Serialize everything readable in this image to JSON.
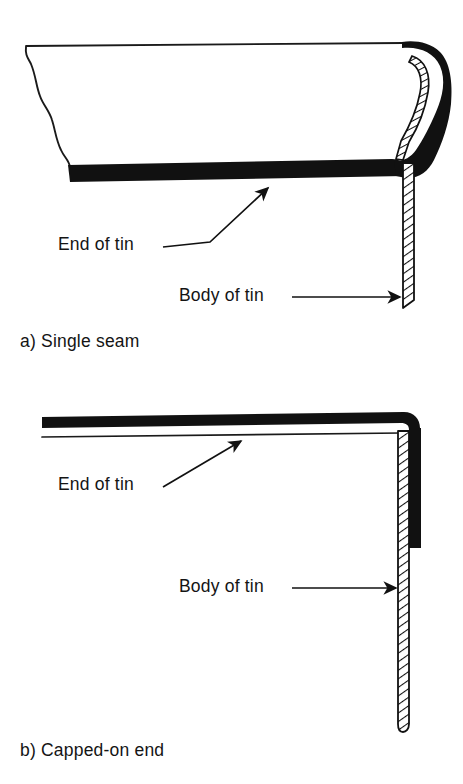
{
  "figure": {
    "kind": "technical-line-drawing",
    "ink_color": "#111111",
    "paper_color": "#ffffff",
    "panels": [
      {
        "id": "a",
        "caption": "a) Single seam",
        "caption_prefix": "a)",
        "caption_text": "Single seam",
        "annotations": [
          {
            "id": "end-of-tin",
            "label": "End of tin",
            "leader": "bent-line-with-arrowhead",
            "points_to": "thick black horizontal end panel"
          },
          {
            "id": "body-of-tin",
            "label": "Body of tin",
            "leader": "straight-horizontal-line-with-arrowhead",
            "points_to": "hatched vertical body wall"
          }
        ],
        "parts": [
          {
            "name": "can-end-profile",
            "style": "thin outline, chamfered left wall"
          },
          {
            "name": "end-panel",
            "style": "solid black thick band"
          },
          {
            "name": "double-seam-curl",
            "style": "solid black curl with hatched body strip rolled inside"
          },
          {
            "name": "body-wall",
            "style": "narrow vertical strip with diagonal hatching"
          }
        ]
      },
      {
        "id": "b",
        "caption": "b) Capped-on end",
        "caption_prefix": "b)",
        "caption_text": "Capped-on end",
        "annotations": [
          {
            "id": "end-of-tin",
            "label": "End of tin",
            "leader": "straight-line-with-arrowhead",
            "points_to": "thick black horizontal end panel"
          },
          {
            "id": "body-of-tin",
            "label": "Body of tin",
            "leader": "straight-horizontal-line-with-arrowhead",
            "points_to": "hatched vertical body wall"
          }
        ],
        "parts": [
          {
            "name": "end-panel",
            "style": "solid black thick bar over thin outline"
          },
          {
            "name": "capped-corner",
            "style": "solid black skirt bent down over body wall"
          },
          {
            "name": "body-wall",
            "style": "narrow vertical strip with diagonal hatching, rounded bottom"
          }
        ]
      }
    ]
  }
}
